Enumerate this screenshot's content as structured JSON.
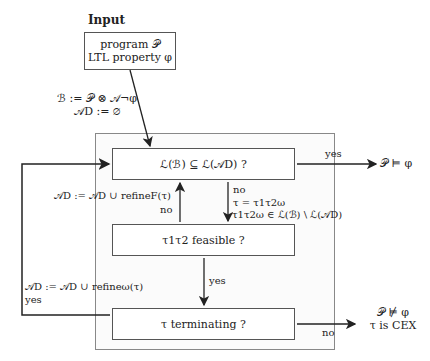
{
  "input": {
    "heading": "Input",
    "line1": "program 𝒫",
    "line2": "LTL property φ"
  },
  "init": {
    "line1": "ℬ := 𝒫 ⊗ 𝒜¬φ",
    "line2": "𝒜D := ∅"
  },
  "boxes": {
    "inclusion": "ℒ(ℬ) ⊆ ℒ(𝒜D) ?",
    "feasible": "τ1τ2 feasible ?",
    "terminating": "τ terminating ?"
  },
  "edges": {
    "inclusion_yes": "yes",
    "inclusion_yes_result": "𝒫 ⊨ φ",
    "inclusion_no": "no",
    "inclusion_no_tau": "τ = τ1τ2ω",
    "inclusion_no_member": "τ1τ2ω ∈ ℒ(ℬ) \\ ℒ(𝒜D)",
    "feasible_no": "no",
    "refine_F": "𝒜D := 𝒜D ∪ refineF(τ)",
    "feasible_yes": "yes",
    "terminating_yes": "yes",
    "refine_omega": "𝒜D := 𝒜D ∪ refineω(τ)",
    "terminating_no": "no",
    "cex_line1": "𝒫 ⊭ φ",
    "cex_line2": "τ is CEX"
  }
}
